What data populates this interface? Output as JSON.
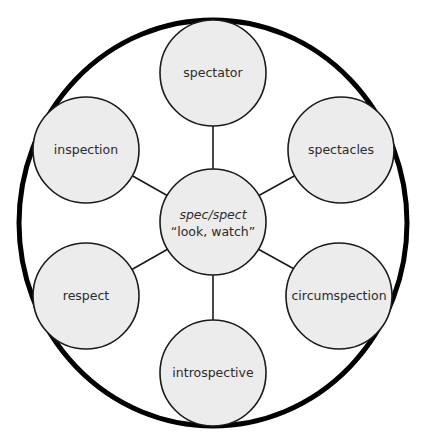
{
  "diagram": {
    "type": "word-web",
    "center": {
      "root": "spec/spect",
      "meaning": "“look, watch”"
    },
    "nodes": [
      {
        "label": "spectator"
      },
      {
        "label": "spectacles"
      },
      {
        "label": "circumspection"
      },
      {
        "label": "introspective"
      },
      {
        "label": "respect"
      },
      {
        "label": "inspection"
      }
    ],
    "colors": {
      "node_fill": "#ececec",
      "stroke": "#1a1a1a",
      "outer_ring": "#000000",
      "text": "#2b2b2b"
    }
  }
}
